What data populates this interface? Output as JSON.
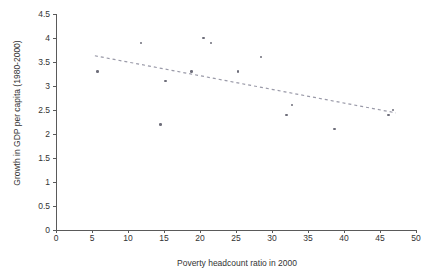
{
  "chart_data": {
    "type": "scatter",
    "title": "",
    "xlabel": "Poverty headcount ratio in 2000",
    "ylabel": "Growth in GDP per capita (1980-2000)",
    "xlim": [
      0,
      50
    ],
    "ylim": [
      0,
      4.5
    ],
    "xticks": [
      "0",
      "5",
      "10",
      "15",
      "20",
      "25",
      "30",
      "35",
      "40",
      "45",
      "50"
    ],
    "yticks": [
      "0",
      "0.5",
      "1",
      "1.5",
      "2",
      "2.5",
      "3",
      "3.5",
      "4",
      "4.5"
    ],
    "grid": false,
    "legend": "none",
    "point_color": "#6e6e7a",
    "trendline_color": "#9a9aa8",
    "points": [
      {
        "x": 5.8,
        "y": 3.3
      },
      {
        "x": 11.8,
        "y": 3.9
      },
      {
        "x": 14.5,
        "y": 2.2
      },
      {
        "x": 15.2,
        "y": 3.1
      },
      {
        "x": 18.8,
        "y": 3.3
      },
      {
        "x": 20.5,
        "y": 4.0
      },
      {
        "x": 21.5,
        "y": 3.9
      },
      {
        "x": 25.3,
        "y": 3.3
      },
      {
        "x": 28.5,
        "y": 3.6
      },
      {
        "x": 32.0,
        "y": 2.4
      },
      {
        "x": 32.8,
        "y": 2.6
      },
      {
        "x": 38.7,
        "y": 2.1
      },
      {
        "x": 46.2,
        "y": 2.4
      },
      {
        "x": 46.8,
        "y": 2.5
      }
    ],
    "trendline": {
      "style": "dashed",
      "x0": 5.4,
      "y0": 3.63,
      "x1": 47.2,
      "y1": 2.44
    }
  }
}
